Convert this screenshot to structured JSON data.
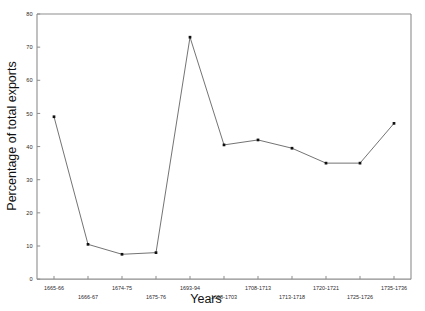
{
  "chart_data": {
    "type": "line",
    "title": "",
    "xlabel": "Years",
    "ylabel": "Percentage of total exports",
    "categories": [
      "1665-66",
      "1666-67",
      "1674-75",
      "1675-76",
      "1693-94",
      "1698-1703",
      "1708-1713",
      "1713-1718",
      "1720-1721",
      "1725-1726",
      "1735-1736"
    ],
    "values": [
      49,
      10.5,
      7.5,
      8,
      73,
      40.5,
      42,
      39.5,
      35,
      35,
      47
    ],
    "series": [
      {
        "name": "Percentage of total exports",
        "values": [
          49,
          10.5,
          7.5,
          8,
          73,
          40.5,
          42,
          39.5,
          35,
          35,
          47
        ]
      }
    ],
    "ylim": [
      0,
      80
    ],
    "yticks": [
      0,
      10,
      20,
      30,
      40,
      50,
      60,
      70,
      80
    ],
    "ytick_labels": [
      "0",
      "10",
      "20",
      "30",
      "40",
      "50",
      "60",
      "70",
      "80"
    ],
    "grid": false,
    "legend": "none",
    "marker": "filled-square",
    "marker_color": "#111111",
    "line_color": "#5a5a5a",
    "axis_color": "#8d8d8d",
    "xtick_row_upper": [
      "1665-66",
      "1674-75",
      "1693-94",
      "1708-1713",
      "1720-1721",
      "1735-1736"
    ],
    "xtick_row_lower": [
      "1666-67",
      "1675-76",
      "1698-1703",
      "1713-1718",
      "1725-1726"
    ]
  }
}
